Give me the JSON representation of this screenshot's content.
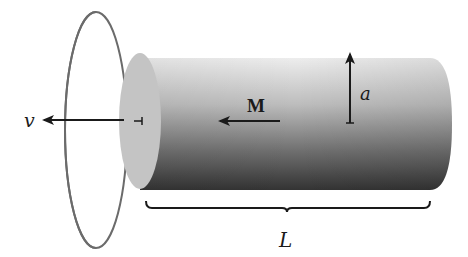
{
  "figure": {
    "labels": {
      "velocity": "v",
      "magnetization": "M",
      "radius": "a",
      "length": "L"
    },
    "colors": {
      "background": "#ffffff",
      "ink": "#1a1a1a",
      "loop_stroke": "#6b6b6b",
      "end_face": "#c4c4c4",
      "cylinder_top": "#e6e6e6",
      "cylinder_bottom": "#3a3a3a"
    }
  }
}
